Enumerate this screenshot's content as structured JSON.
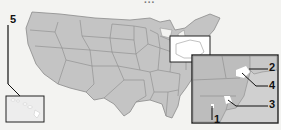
{
  "map": {
    "subject": "United States",
    "top_text_partial": "...",
    "colors": {
      "land": "#c4c4c4",
      "border": "#8a8a8a",
      "background": "#f3f3f1",
      "inset_frame": "#222222",
      "highlight": "#ffffff"
    },
    "insets": [
      {
        "name": "new-england-locator",
        "label": ""
      },
      {
        "name": "northeast-detail",
        "label": ""
      },
      {
        "name": "hawaii",
        "label": "5"
      }
    ],
    "callouts": [
      {
        "label": "1"
      },
      {
        "label": "2"
      },
      {
        "label": "3"
      },
      {
        "label": "4"
      },
      {
        "label": "5"
      }
    ]
  }
}
